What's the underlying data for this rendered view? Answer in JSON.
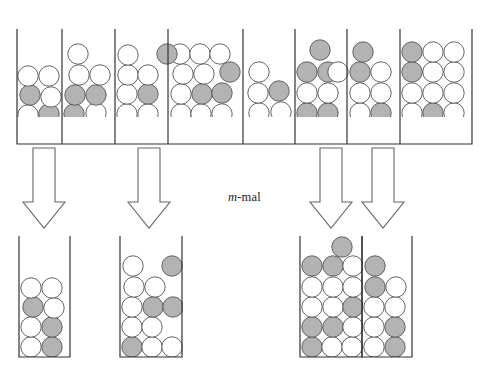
{
  "figure": {
    "type": "diagram",
    "caption_text": "m-mal",
    "caption_italic_part": "m",
    "caption_rest": "-mal",
    "caption_x": 228,
    "caption_y": 190
  },
  "colors": {
    "ball_white_fill": "#ffffff",
    "ball_gray_fill": "#b3b3b3",
    "ball_stroke": "#555555",
    "tube_stroke": "#333333",
    "arrow_stroke": "#666666",
    "arrow_fill": "#ffffff",
    "background": "#ffffff"
  },
  "geometry": {
    "ball_radius": 10.2,
    "top_row_baseline_y": 143,
    "bottom_row_baseline_y": 357,
    "top_tube_top_y": 29,
    "bottom_tube_top_y": 236
  },
  "top_row": {
    "name": "top-tube-row",
    "tube_count": 8,
    "frame": {
      "x": 17,
      "y": 29,
      "width": 455,
      "height": 115
    },
    "dividers_x": [
      62,
      115,
      168,
      243,
      295,
      347,
      400
    ],
    "tubes": [
      {
        "id": "top-tube-1",
        "x0": 17,
        "x1": 62,
        "balls": [
          {
            "cx": 29,
            "cy": 133,
            "color": "white"
          },
          {
            "cx": 50,
            "cy": 133,
            "color": "gray"
          },
          {
            "cx": 28,
            "cy": 115,
            "color": "white"
          },
          {
            "cx": 49,
            "cy": 114,
            "color": "gray"
          },
          {
            "cx": 30,
            "cy": 95,
            "color": "gray"
          },
          {
            "cx": 51,
            "cy": 97,
            "color": "white"
          },
          {
            "cx": 28,
            "cy": 76,
            "color": "white"
          },
          {
            "cx": 49,
            "cy": 76,
            "color": "white"
          }
        ]
      },
      {
        "id": "top-tube-2",
        "x0": 62,
        "x1": 115,
        "balls": [
          {
            "cx": 74,
            "cy": 133,
            "color": "white"
          },
          {
            "cx": 95,
            "cy": 133,
            "color": "white"
          },
          {
            "cx": 74,
            "cy": 114,
            "color": "gray"
          },
          {
            "cx": 96,
            "cy": 113,
            "color": "white"
          },
          {
            "cx": 75,
            "cy": 95,
            "color": "gray"
          },
          {
            "cx": 96,
            "cy": 95,
            "color": "gray"
          },
          {
            "cx": 79,
            "cy": 75,
            "color": "white"
          },
          {
            "cx": 100,
            "cy": 75,
            "color": "white"
          },
          {
            "cx": 78,
            "cy": 54,
            "color": "white"
          }
        ]
      },
      {
        "id": "top-tube-3",
        "x0": 115,
        "x1": 168,
        "balls": [
          {
            "cx": 128,
            "cy": 133,
            "color": "gray"
          },
          {
            "cx": 148,
            "cy": 133,
            "color": "white"
          },
          {
            "cx": 127,
            "cy": 114,
            "color": "white"
          },
          {
            "cx": 148,
            "cy": 114,
            "color": "white"
          },
          {
            "cx": 127,
            "cy": 94,
            "color": "white"
          },
          {
            "cx": 148,
            "cy": 94,
            "color": "gray"
          },
          {
            "cx": 128,
            "cy": 75,
            "color": "white"
          },
          {
            "cx": 148,
            "cy": 75,
            "color": "white"
          },
          {
            "cx": 128,
            "cy": 55,
            "color": "white"
          }
        ]
      },
      {
        "id": "top-tube-4",
        "x0": 168,
        "x1": 243,
        "balls": [
          {
            "cx": 181,
            "cy": 133,
            "color": "gray"
          },
          {
            "cx": 201,
            "cy": 133,
            "color": "white"
          },
          {
            "cx": 221,
            "cy": 133,
            "color": "white"
          },
          {
            "cx": 181,
            "cy": 114,
            "color": "white"
          },
          {
            "cx": 201,
            "cy": 114,
            "color": "white"
          },
          {
            "cx": 222,
            "cy": 114,
            "color": "white"
          },
          {
            "cx": 181,
            "cy": 94,
            "color": "white"
          },
          {
            "cx": 202,
            "cy": 94,
            "color": "gray"
          },
          {
            "cx": 222,
            "cy": 93,
            "color": "gray"
          },
          {
            "cx": 183,
            "cy": 74,
            "color": "white"
          },
          {
            "cx": 204,
            "cy": 74,
            "color": "white"
          },
          {
            "cx": 230,
            "cy": 72,
            "color": "gray"
          },
          {
            "cx": 180,
            "cy": 54,
            "color": "white"
          },
          {
            "cx": 200,
            "cy": 54,
            "color": "white"
          },
          {
            "cx": 220,
            "cy": 54,
            "color": "white"
          },
          {
            "cx": 167,
            "cy": 54,
            "color": "gray"
          }
        ]
      },
      {
        "id": "top-tube-5",
        "x0": 243,
        "x1": 295,
        "balls": [
          {
            "cx": 256,
            "cy": 133,
            "color": "gray"
          },
          {
            "cx": 277,
            "cy": 133,
            "color": "gray"
          },
          {
            "cx": 259,
            "cy": 113,
            "color": "white"
          },
          {
            "cx": 281,
            "cy": 112,
            "color": "white"
          },
          {
            "cx": 258,
            "cy": 93,
            "color": "white"
          },
          {
            "cx": 279,
            "cy": 91,
            "color": "gray"
          },
          {
            "cx": 259,
            "cy": 72,
            "color": "white"
          }
        ]
      },
      {
        "id": "top-tube-6",
        "x0": 295,
        "x1": 347,
        "balls": [
          {
            "cx": 307,
            "cy": 133,
            "color": "gray"
          },
          {
            "cx": 328,
            "cy": 133,
            "color": "white"
          },
          {
            "cx": 307,
            "cy": 113,
            "color": "gray"
          },
          {
            "cx": 328,
            "cy": 113,
            "color": "gray"
          },
          {
            "cx": 307,
            "cy": 93,
            "color": "white"
          },
          {
            "cx": 328,
            "cy": 93,
            "color": "white"
          },
          {
            "cx": 307,
            "cy": 72,
            "color": "gray"
          },
          {
            "cx": 328,
            "cy": 72,
            "color": "gray"
          },
          {
            "cx": 338,
            "cy": 72,
            "color": "white"
          },
          {
            "cx": 320,
            "cy": 50,
            "color": "gray"
          }
        ]
      },
      {
        "id": "top-tube-7",
        "x0": 347,
        "x1": 400,
        "balls": [
          {
            "cx": 360,
            "cy": 133,
            "color": "gray"
          },
          {
            "cx": 381,
            "cy": 133,
            "color": "white"
          },
          {
            "cx": 360,
            "cy": 113,
            "color": "white"
          },
          {
            "cx": 381,
            "cy": 113,
            "color": "gray"
          },
          {
            "cx": 360,
            "cy": 93,
            "color": "white"
          },
          {
            "cx": 381,
            "cy": 93,
            "color": "white"
          },
          {
            "cx": 360,
            "cy": 72,
            "color": "gray"
          },
          {
            "cx": 381,
            "cy": 72,
            "color": "white"
          },
          {
            "cx": 363,
            "cy": 52,
            "color": "gray"
          }
        ]
      },
      {
        "id": "top-tube-8",
        "x0": 400,
        "x1": 472,
        "balls": [
          {
            "cx": 412,
            "cy": 133,
            "color": "gray"
          },
          {
            "cx": 433,
            "cy": 133,
            "color": "white"
          },
          {
            "cx": 453,
            "cy": 133,
            "color": "white"
          },
          {
            "cx": 412,
            "cy": 113,
            "color": "white"
          },
          {
            "cx": 433,
            "cy": 113,
            "color": "gray"
          },
          {
            "cx": 454,
            "cy": 113,
            "color": "white"
          },
          {
            "cx": 412,
            "cy": 93,
            "color": "white"
          },
          {
            "cx": 433,
            "cy": 93,
            "color": "white"
          },
          {
            "cx": 454,
            "cy": 93,
            "color": "white"
          },
          {
            "cx": 412,
            "cy": 72,
            "color": "gray"
          },
          {
            "cx": 433,
            "cy": 72,
            "color": "white"
          },
          {
            "cx": 454,
            "cy": 72,
            "color": "white"
          },
          {
            "cx": 412,
            "cy": 52,
            "color": "gray"
          },
          {
            "cx": 433,
            "cy": 52,
            "color": "white"
          },
          {
            "cx": 454,
            "cy": 52,
            "color": "white"
          }
        ]
      }
    ]
  },
  "arrows": {
    "name": "transition-arrows",
    "count": 4,
    "items": [
      {
        "id": "arrow-1",
        "cx": 44,
        "top": 148,
        "bottom": 228,
        "shaft_half": 11,
        "head_half": 21
      },
      {
        "id": "arrow-2",
        "cx": 149,
        "top": 148,
        "bottom": 228,
        "shaft_half": 11,
        "head_half": 21
      },
      {
        "id": "arrow-3",
        "cx": 331,
        "top": 148,
        "bottom": 228,
        "shaft_half": 11,
        "head_half": 21
      },
      {
        "id": "arrow-4",
        "cx": 383,
        "top": 148,
        "bottom": 228,
        "shaft_half": 11,
        "head_half": 21
      }
    ]
  },
  "bottom_row": {
    "name": "bottom-tube-row",
    "tube_count": 4,
    "tubes": [
      {
        "id": "bottom-tube-1",
        "x0": 19,
        "x1": 70,
        "top_y": 236,
        "bottom_y": 357,
        "balls": [
          {
            "cx": 31,
            "cy": 347,
            "color": "white"
          },
          {
            "cx": 52,
            "cy": 347,
            "color": "gray"
          },
          {
            "cx": 31,
            "cy": 327,
            "color": "white"
          },
          {
            "cx": 52,
            "cy": 327,
            "color": "gray"
          },
          {
            "cx": 33,
            "cy": 307,
            "color": "gray"
          },
          {
            "cx": 54,
            "cy": 308,
            "color": "white"
          },
          {
            "cx": 31,
            "cy": 288,
            "color": "white"
          },
          {
            "cx": 52,
            "cy": 288,
            "color": "white"
          }
        ]
      },
      {
        "id": "bottom-tube-2",
        "x0": 120,
        "x1": 182,
        "top_y": 236,
        "bottom_y": 357,
        "balls": [
          {
            "cx": 132,
            "cy": 347,
            "color": "gray"
          },
          {
            "cx": 152,
            "cy": 347,
            "color": "white"
          },
          {
            "cx": 172,
            "cy": 347,
            "color": "white"
          },
          {
            "cx": 132,
            "cy": 327,
            "color": "white"
          },
          {
            "cx": 152,
            "cy": 327,
            "color": "white"
          },
          {
            "cx": 132,
            "cy": 307,
            "color": "white"
          },
          {
            "cx": 153,
            "cy": 307,
            "color": "gray"
          },
          {
            "cx": 173,
            "cy": 307,
            "color": "gray"
          },
          {
            "cx": 134,
            "cy": 287,
            "color": "white"
          },
          {
            "cx": 155,
            "cy": 287,
            "color": "white"
          },
          {
            "cx": 133,
            "cy": 266,
            "color": "white"
          },
          {
            "cx": 172,
            "cy": 266,
            "color": "gray"
          }
        ]
      },
      {
        "id": "bottom-tube-3",
        "x0": 300,
        "x1": 362,
        "top_y": 236,
        "bottom_y": 357,
        "balls": [
          {
            "cx": 312,
            "cy": 347,
            "color": "gray"
          },
          {
            "cx": 332,
            "cy": 347,
            "color": "white"
          },
          {
            "cx": 352,
            "cy": 347,
            "color": "white"
          },
          {
            "cx": 312,
            "cy": 327,
            "color": "gray"
          },
          {
            "cx": 333,
            "cy": 327,
            "color": "gray"
          },
          {
            "cx": 353,
            "cy": 327,
            "color": "white"
          },
          {
            "cx": 312,
            "cy": 307,
            "color": "white"
          },
          {
            "cx": 333,
            "cy": 307,
            "color": "white"
          },
          {
            "cx": 353,
            "cy": 307,
            "color": "gray"
          },
          {
            "cx": 312,
            "cy": 287,
            "color": "white"
          },
          {
            "cx": 333,
            "cy": 287,
            "color": "white"
          },
          {
            "cx": 353,
            "cy": 287,
            "color": "white"
          },
          {
            "cx": 312,
            "cy": 266,
            "color": "gray"
          },
          {
            "cx": 333,
            "cy": 266,
            "color": "gray"
          },
          {
            "cx": 353,
            "cy": 266,
            "color": "white"
          },
          {
            "cx": 342,
            "cy": 247,
            "color": "gray"
          }
        ]
      },
      {
        "id": "bottom-tube-4",
        "x0": 362,
        "x1": 412,
        "top_y": 236,
        "bottom_y": 357,
        "balls": [
          {
            "cx": 374,
            "cy": 347,
            "color": "white"
          },
          {
            "cx": 395,
            "cy": 347,
            "color": "gray"
          },
          {
            "cx": 374,
            "cy": 327,
            "color": "white"
          },
          {
            "cx": 395,
            "cy": 327,
            "color": "gray"
          },
          {
            "cx": 374,
            "cy": 307,
            "color": "white"
          },
          {
            "cx": 395,
            "cy": 307,
            "color": "white"
          },
          {
            "cx": 375,
            "cy": 287,
            "color": "gray"
          },
          {
            "cx": 396,
            "cy": 287,
            "color": "white"
          },
          {
            "cx": 375,
            "cy": 266,
            "color": "gray"
          }
        ]
      }
    ]
  }
}
